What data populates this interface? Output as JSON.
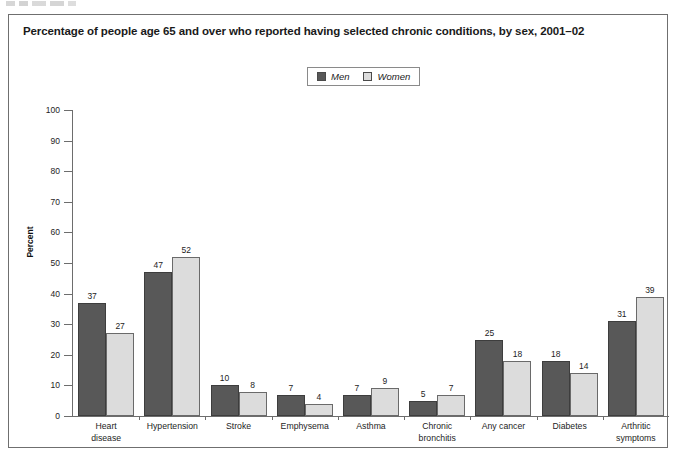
{
  "figure": {
    "title": "Percentage of people age 65 and over who reported having selected chronic conditions, by sex, 2001–02"
  },
  "legend": {
    "position": "top-center",
    "entries": [
      {
        "label": "Men",
        "color": "#585858",
        "icon": "legend-swatch-men"
      },
      {
        "label": "Women",
        "color": "#dcdcdc",
        "icon": "legend-swatch-women"
      }
    ]
  },
  "axes": {
    "y_title": "Percent",
    "y_ticks": [
      "100",
      "90",
      "80",
      "70",
      "60",
      "50",
      "40",
      "30",
      "20",
      "10",
      "0"
    ]
  },
  "chart_data": {
    "type": "bar",
    "title": "Percentage of people age 65 and over who reported having selected chronic conditions, by sex, 2001–02",
    "xlabel": "",
    "ylabel": "Percent",
    "ylim": [
      0,
      100
    ],
    "ytick_step": 10,
    "grid": false,
    "legend_position": "top-center",
    "categories": [
      "Heart disease",
      "Hypertension",
      "Stroke",
      "Emphysema",
      "Asthma",
      "Chronic bronchitis",
      "Any cancer",
      "Diabetes",
      "Arthritic symptoms"
    ],
    "category_lines": [
      [
        "Heart",
        "disease"
      ],
      [
        "Hypertension"
      ],
      [
        "Stroke"
      ],
      [
        "Emphysema"
      ],
      [
        "Asthma"
      ],
      [
        "Chronic",
        "bronchitis"
      ],
      [
        "Any cancer"
      ],
      [
        "Diabetes"
      ],
      [
        "Arthritic",
        "symptoms"
      ]
    ],
    "series": [
      {
        "name": "Men",
        "color": "#585858",
        "values": [
          37,
          47,
          10,
          7,
          7,
          5,
          25,
          18,
          31
        ]
      },
      {
        "name": "Women",
        "color": "#dcdcdc",
        "values": [
          27,
          52,
          8,
          4,
          9,
          7,
          18,
          14,
          39
        ]
      }
    ]
  }
}
